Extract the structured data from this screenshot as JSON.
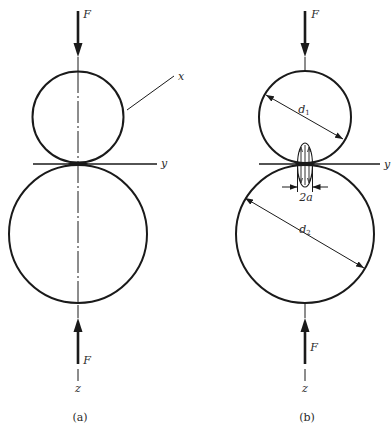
{
  "figure": {
    "background": "#ffffff",
    "stroke_color": "#1a1a1a",
    "panels": [
      {
        "id": "a",
        "caption": "(a)",
        "labels": {
          "force_top": "F",
          "force_bottom": "F",
          "x_axis": "x",
          "y_axis": "y",
          "z_axis": "z"
        }
      },
      {
        "id": "b",
        "caption": "(b)",
        "labels": {
          "force_top": "F",
          "force_bottom": "F",
          "y_axis": "y",
          "z_axis": "z",
          "d1_main": "d",
          "d1_sub": "1",
          "d2_main": "d",
          "d2_sub": "2",
          "contact_width": "2a"
        }
      }
    ]
  }
}
